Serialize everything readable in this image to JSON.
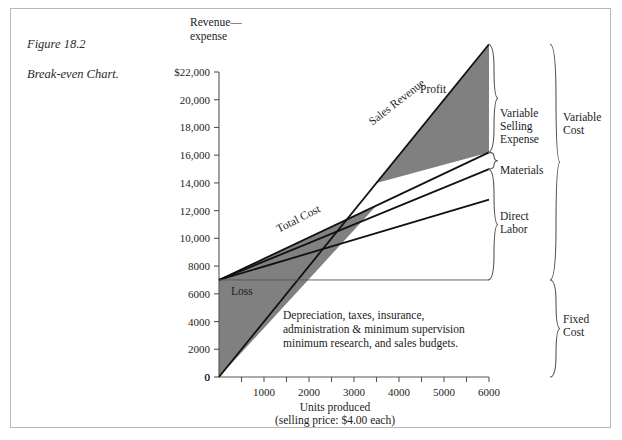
{
  "figure": {
    "caption_line1": "Figure 18.2",
    "caption_line2": "Break-even Chart."
  },
  "axes": {
    "y_title_line1": "Revenue—",
    "y_title_line2": "expense",
    "x_title": "Units produced",
    "x_subtitle": "(selling price:  $4.00 each)"
  },
  "labels": {
    "sales_revenue": "Sales Revenue",
    "total_cost": "Total Cost",
    "profit": "Profit",
    "loss": "Loss",
    "variable_selling_expense_l1": "Variable",
    "variable_selling_expense_l2": "Selling",
    "variable_selling_expense_l3": "Expense",
    "materials": "Materials",
    "direct_labor_l1": "Direct",
    "direct_labor_l2": "Labor",
    "variable_cost_l1": "Variable",
    "variable_cost_l2": "Cost",
    "fixed_cost_l1": "Fixed",
    "fixed_cost_l2": "Cost",
    "fixed_note_l1": "Depreciation, taxes, insurance,",
    "fixed_note_l2": "administration & minimum supervision",
    "fixed_note_l3": "minimum research, and sales budgets."
  },
  "colors": {
    "fill_gray": "#808080",
    "line": "#111111",
    "axis": "#555555",
    "frame": "#b9b9b9",
    "text": "#1c1c1c"
  },
  "chart_data": {
    "type": "line",
    "title": "Break-even Chart",
    "xlabel": "Units produced (selling price: $4.00 each)",
    "ylabel": "Revenue—expense",
    "xlim": [
      0,
      6000
    ],
    "ylim": [
      0,
      22000
    ],
    "grid": false,
    "legend": "inline-annotations",
    "x_ticks": [
      0,
      1000,
      2000,
      3000,
      4000,
      5000,
      6000
    ],
    "x_tick_labels": [
      "0",
      "1000",
      "2000",
      "3000",
      "4000",
      "5000",
      "6000"
    ],
    "x_minor_ticks": [
      500,
      1500,
      2500,
      3500,
      4500,
      5500
    ],
    "y_ticks": [
      0,
      2000,
      4000,
      6000,
      8000,
      10000,
      12000,
      14000,
      16000,
      18000,
      20000,
      22000
    ],
    "y_tick_labels": [
      "0",
      "2000",
      "4000",
      "6000",
      "8000",
      "10,000",
      "12,000",
      "14,000",
      "16,000",
      "18,000",
      "20,000",
      "$22,000"
    ],
    "break_even_units": 3500,
    "break_even_revenue": 14000,
    "fixed_cost": 7000,
    "series": [
      {
        "name": "Sales Revenue",
        "x": [
          0,
          6000
        ],
        "values": [
          0,
          24000
        ],
        "note": "slope $4.00 per unit"
      },
      {
        "name": "Total Cost",
        "x": [
          0,
          6000
        ],
        "values": [
          7000,
          16200
        ]
      },
      {
        "name": "Materials",
        "x": [
          0,
          6000
        ],
        "values": [
          7000,
          15000
        ]
      },
      {
        "name": "Direct Labor",
        "x": [
          0,
          6000
        ],
        "values": [
          7000,
          12800
        ]
      },
      {
        "name": "Fixed Cost",
        "x": [
          0,
          6000
        ],
        "values": [
          7000,
          7000
        ]
      }
    ],
    "regions": [
      {
        "name": "Profit",
        "fill": "#808080",
        "between": [
          "Sales Revenue",
          "Total Cost"
        ],
        "from_units": 3500,
        "to_units": 6000
      },
      {
        "name": "Loss",
        "fill": "#808080",
        "between": [
          "Total Cost",
          "Sales Revenue"
        ],
        "from_units": 0,
        "to_units": 3500
      }
    ]
  }
}
